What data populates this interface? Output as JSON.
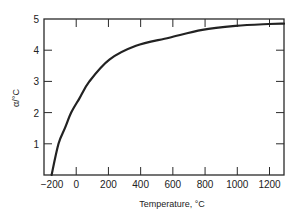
{
  "chart_data": {
    "type": "line",
    "title": "",
    "xlabel": "Temperature, °C",
    "ylabel": "α/°C",
    "xlim": [
      -200,
      1290
    ],
    "ylim": [
      0,
      5
    ],
    "grid": false,
    "legend": null,
    "x_ticks": [
      -200,
      0,
      200,
      400,
      600,
      800,
      1000,
      1200
    ],
    "x_tick_labels": [
      "−200",
      "0",
      "200",
      "400",
      "600",
      "800",
      "1000",
      "1200"
    ],
    "y_ticks": [
      1,
      2,
      3,
      4,
      5
    ],
    "y_tick_labels": [
      "1",
      "2",
      "3",
      "4",
      "5"
    ],
    "series": [
      {
        "name": "α",
        "color": "#222222",
        "x": [
          -153,
          -110,
          -70,
          -31,
          19,
          82,
          206,
          371,
          577,
          783,
          990,
          1196,
          1290
        ],
        "y": [
          0,
          1,
          1.5,
          2,
          2.45,
          3,
          3.7,
          4.14,
          4.4,
          4.65,
          4.78,
          4.84,
          4.85
        ]
      }
    ]
  }
}
